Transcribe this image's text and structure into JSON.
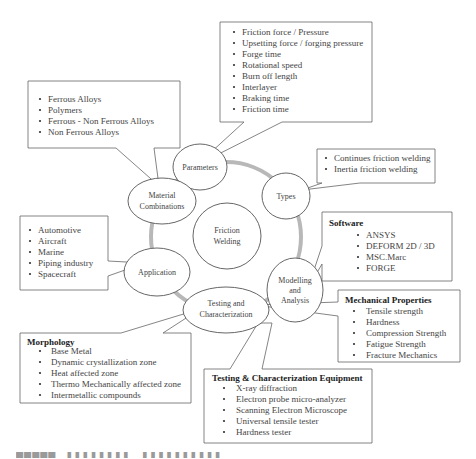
{
  "diagram": {
    "center": {
      "label_lines": [
        "Friction",
        "Welding"
      ]
    },
    "nodes": [
      {
        "id": "parameters",
        "label_lines": [
          "Parameters"
        ]
      },
      {
        "id": "types",
        "label_lines": [
          "Types"
        ]
      },
      {
        "id": "modelling",
        "label_lines": [
          "Modelling",
          "and",
          "Analysis"
        ]
      },
      {
        "id": "testing",
        "label_lines": [
          "Testing and",
          "Characterization"
        ]
      },
      {
        "id": "application",
        "label_lines": [
          "Application"
        ]
      },
      {
        "id": "material",
        "label_lines": [
          "Material",
          "Combinations"
        ]
      }
    ],
    "callouts": {
      "parameters": {
        "heading": null,
        "items": [
          "Friction force / Pressure",
          "Upsetting force / forging pressure",
          "Forge time",
          "Rotational speed",
          "Burn off length",
          "Interlayer",
          "Braking time",
          "Friction time"
        ]
      },
      "material": {
        "heading": null,
        "items": [
          "Ferrous Alloys",
          "Polymers",
          "Ferrous - Non Ferrous Alloys",
          "Non Ferrous Alloys"
        ]
      },
      "types": {
        "heading": null,
        "items": [
          "Continues friction welding",
          "Inertia friction welding"
        ]
      },
      "software": {
        "heading": "Software",
        "items": [
          "ANSYS",
          "DEFORM  2D / 3D",
          "MSC.Marc",
          "FORGE"
        ]
      },
      "application": {
        "heading": null,
        "items": [
          "Automotive",
          "Aircraft",
          "Marine",
          "Piping industry",
          "Spacecraft"
        ]
      },
      "mechanical": {
        "heading": "Mechanical Properties",
        "items": [
          "Tensile strength",
          "Hardness",
          "Compression Strength",
          "Fatigue Strength",
          "Fracture Mechanics"
        ]
      },
      "morphology": {
        "heading": "Morphology",
        "items": [
          "Base Metal",
          "Dynamic crystallization zone",
          "Heat affected zone",
          "Thermo Mechanically affected zone",
          "Intermetallic compounds"
        ]
      },
      "equipment": {
        "heading": "Testing & Characterization Equipment",
        "items": [
          "X-ray diffraction",
          "Electron probe micro-analyzer",
          "Scanning Electron Microscope",
          "Universal tensile tester",
          "Hardness tester"
        ]
      }
    },
    "colors": {
      "ring": "#b8b8b8",
      "stroke": "#555555",
      "text": "#444444"
    }
  }
}
